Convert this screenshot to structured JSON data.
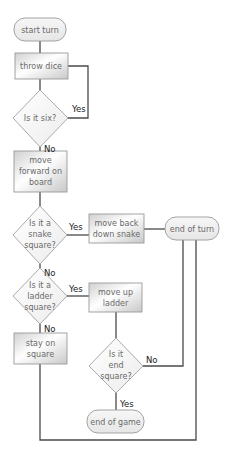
{
  "diagram": {
    "type": "flowchart",
    "colors": {
      "line": "#4a4a4a",
      "node_border": "#999999",
      "node_fill_light": "#ffffff",
      "node_fill_dark": "#d2d2d2",
      "text": "#6a6a6a",
      "label": "#222222"
    },
    "nodes": {
      "start_turn": {
        "shape": "terminator",
        "lines": [
          "start turn"
        ]
      },
      "throw_dice": {
        "shape": "process",
        "lines": [
          "throw dice"
        ]
      },
      "is_six": {
        "shape": "decision",
        "lines": [
          "Is it six?"
        ]
      },
      "move_forward": {
        "shape": "process",
        "lines": [
          "move",
          "forward on",
          "board"
        ]
      },
      "is_snake": {
        "shape": "decision",
        "lines": [
          "Is it a",
          "snake",
          "square?"
        ]
      },
      "move_back": {
        "shape": "process",
        "lines": [
          "move back",
          "down snake"
        ]
      },
      "end_turn": {
        "shape": "terminator",
        "lines": [
          "end of turn"
        ]
      },
      "is_ladder": {
        "shape": "decision",
        "lines": [
          "Is it a",
          "ladder",
          "square?"
        ]
      },
      "move_up": {
        "shape": "process",
        "lines": [
          "move up",
          "ladder"
        ]
      },
      "stay": {
        "shape": "process",
        "lines": [
          "stay on",
          "square"
        ]
      },
      "is_end": {
        "shape": "decision",
        "lines": [
          "Is it",
          "end",
          "square?"
        ]
      },
      "end_game": {
        "shape": "terminator",
        "lines": [
          "end of game"
        ]
      }
    },
    "edges": [
      {
        "from": "start_turn",
        "to": "throw_dice",
        "label": ""
      },
      {
        "from": "throw_dice",
        "to": "is_six",
        "label": ""
      },
      {
        "from": "is_six",
        "to": "throw_dice",
        "label": "Yes"
      },
      {
        "from": "is_six",
        "to": "move_forward",
        "label": "No"
      },
      {
        "from": "move_forward",
        "to": "is_snake",
        "label": ""
      },
      {
        "from": "is_snake",
        "to": "move_back",
        "label": "Yes"
      },
      {
        "from": "move_back",
        "to": "end_turn",
        "label": ""
      },
      {
        "from": "is_snake",
        "to": "is_ladder",
        "label": "No"
      },
      {
        "from": "is_ladder",
        "to": "move_up",
        "label": "Yes"
      },
      {
        "from": "is_ladder",
        "to": "stay",
        "label": "No"
      },
      {
        "from": "move_up",
        "to": "is_end",
        "label": ""
      },
      {
        "from": "is_end",
        "to": "end_turn",
        "label": "No"
      },
      {
        "from": "is_end",
        "to": "end_game",
        "label": "Yes"
      },
      {
        "from": "stay",
        "to": "end_turn",
        "label": ""
      }
    ],
    "labels": {
      "six_yes": "Yes",
      "six_no": "No",
      "snake_yes": "Yes",
      "snake_no": "No",
      "ladder_yes": "Yes",
      "ladder_no": "No",
      "end_no": "No",
      "end_yes": "Yes"
    }
  }
}
